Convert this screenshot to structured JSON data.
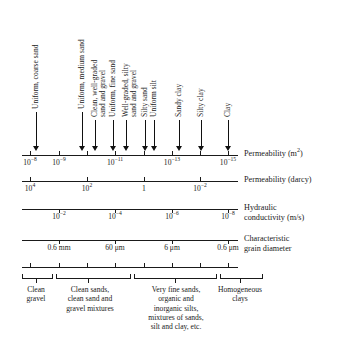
{
  "figure": {
    "ink_color": "#1a1a1a"
  },
  "callouts": [
    {
      "label": "Uniform, coarse sand",
      "x": 36,
      "text_top": 16,
      "arrow_top": 112,
      "arrow_bottom": 151
    },
    {
      "label": "Uniform, medium sand",
      "x": 82,
      "text_top": 16,
      "arrow_top": 112,
      "arrow_bottom": 151
    },
    {
      "label": "Clean, well-graded\nsand and gravel",
      "x": 95,
      "text_top": 38,
      "arrow_top": 120,
      "arrow_bottom": 151
    },
    {
      "label": "Uniform, fine sand",
      "x": 113,
      "text_top": 48,
      "arrow_top": 120,
      "arrow_bottom": 151
    },
    {
      "label": "Well-graded, silty\nsand and gravel",
      "x": 126,
      "text_top": 41,
      "arrow_top": 120,
      "arrow_bottom": 151
    },
    {
      "label": "Silty sand",
      "x": 145,
      "text_top": 76,
      "arrow_top": 120,
      "arrow_bottom": 151
    },
    {
      "label": "Uniform silt",
      "x": 154,
      "text_top": 70,
      "arrow_top": 120,
      "arrow_bottom": 151
    },
    {
      "label": "Sandy clay",
      "x": 179,
      "text_top": 74,
      "arrow_top": 120,
      "arrow_bottom": 151
    },
    {
      "label": "Silty clay",
      "x": 201,
      "text_top": 78,
      "arrow_top": 120,
      "arrow_bottom": 151
    },
    {
      "label": "Clay",
      "x": 228,
      "text_top": 96,
      "arrow_top": 120,
      "arrow_bottom": 151
    }
  ],
  "scales": [
    {
      "name": "permeability-m2",
      "caption": "Permeability (m",
      "caption_sup": "2",
      "caption_tail": ")",
      "axis_y": 155,
      "axis_x0": 22,
      "axis_x1": 238,
      "tick_dir": "up",
      "label_y": 158,
      "ticks": [
        {
          "x": 30,
          "label": "10",
          "sup": "−8"
        },
        {
          "x": 59,
          "label": "10",
          "sup": "−9"
        },
        {
          "x": 87,
          "label": "",
          "sup": ""
        },
        {
          "x": 115,
          "label": "10",
          "sup": "−11"
        },
        {
          "x": 144,
          "label": "",
          "sup": ""
        },
        {
          "x": 172,
          "label": "10",
          "sup": "−13"
        },
        {
          "x": 200,
          "label": "",
          "sup": ""
        },
        {
          "x": 228,
          "label": "10",
          "sup": "−15"
        }
      ]
    },
    {
      "name": "permeability-darcy",
      "caption": "Permeability (darcy)",
      "caption_sup": "",
      "caption_tail": "",
      "axis_y": 181,
      "axis_x0": 22,
      "axis_x1": 238,
      "tick_dir": "up",
      "label_y": 184,
      "ticks": [
        {
          "x": 30,
          "label": "10",
          "sup": "4"
        },
        {
          "x": 87,
          "label": "10",
          "sup": "2"
        },
        {
          "x": 144,
          "label": "1",
          "sup": ""
        },
        {
          "x": 200,
          "label": "10",
          "sup": "−2"
        }
      ]
    },
    {
      "name": "hydraulic-conductivity",
      "caption": "Hydraulic\nconductivity (m/s)",
      "caption_sup": "",
      "caption_tail": "",
      "axis_y": 209,
      "axis_x0": 22,
      "axis_x1": 238,
      "tick_dir": "down",
      "label_y": 212,
      "ticks": [
        {
          "x": 59,
          "label": "10",
          "sup": "−2"
        },
        {
          "x": 115,
          "label": "10",
          "sup": "−4"
        },
        {
          "x": 172,
          "label": "10",
          "sup": "−6"
        },
        {
          "x": 228,
          "label": "10",
          "sup": "−8"
        }
      ]
    },
    {
      "name": "characteristic-grain-diameter",
      "caption": "Characteristic\ngrain diameter",
      "caption_sup": "",
      "caption_tail": "",
      "axis_y": 240,
      "axis_x0": 22,
      "axis_x1": 238,
      "tick_dir": "down",
      "label_y": 243,
      "ticks": [
        {
          "x": 59,
          "label": "0.6 mm",
          "sup": ""
        },
        {
          "x": 115,
          "label": "60 μm",
          "sup": ""
        },
        {
          "x": 172,
          "label": "6 μm",
          "sup": ""
        },
        {
          "x": 228,
          "label": "0.6 μm",
          "sup": ""
        }
      ]
    }
  ],
  "minor_rule": {
    "name": "minor-tick-rule",
    "axis_y": 267,
    "axis_x0": 22,
    "axis_x1": 238,
    "ticks": [
      30,
      59,
      87,
      115,
      144,
      172,
      200,
      228
    ]
  },
  "classification": {
    "band_y": 278,
    "segments": [
      {
        "name": "clean-gravel",
        "x0": 22,
        "x1": 52,
        "tick": 36,
        "label": "Clean\ngravel",
        "label_x": 36,
        "label_w": 40
      },
      {
        "name": "clean-sands",
        "x0": 56,
        "x1": 130,
        "tick": 88,
        "label": "Clean sands,\nclean sand and\ngravel mixtures",
        "label_x": 90,
        "label_w": 82
      },
      {
        "name": "very-fine-sands",
        "x0": 134,
        "x1": 216,
        "tick": 175,
        "label": "Very fine sands,\norganic and\ninorganic silts,\nmixtures of sands,\nsilt and clay, etc.",
        "label_x": 176,
        "label_w": 88
      },
      {
        "name": "homogeneous-clays",
        "x0": 220,
        "x1": 262,
        "tick": 240,
        "label": "Homogeneous\nclays",
        "label_x": 240,
        "label_w": 70
      }
    ]
  },
  "chart_data": {
    "type": "table",
    "axis_scales": {
      "permeability_m2": [
        "1e-8",
        "1e-9",
        "1e-10",
        "1e-11",
        "1e-12",
        "1e-13",
        "1e-14",
        "1e-15"
      ],
      "permeability_darcy": [
        "1e4",
        "1e2",
        "1",
        "1e-2"
      ],
      "hydraulic_conductivity_m_per_s": [
        "1e-2",
        "1e-4",
        "1e-6",
        "1e-8"
      ],
      "characteristic_grain_diameter": [
        "0.6 mm",
        "60 μm",
        "6 μm",
        "0.6 μm"
      ]
    },
    "soil_markers": [
      "Uniform, coarse sand",
      "Uniform, medium sand",
      "Clean, well-graded sand and gravel",
      "Uniform, fine sand",
      "Well-graded, silty sand and gravel",
      "Silty sand",
      "Uniform silt",
      "Sandy clay",
      "Silty clay",
      "Clay"
    ],
    "classes": [
      "Clean gravel",
      "Clean sands, clean sand and gravel mixtures",
      "Very fine sands, organic and inorganic silts, mixtures of sands, silt and clay, etc.",
      "Homogeneous clays"
    ]
  }
}
